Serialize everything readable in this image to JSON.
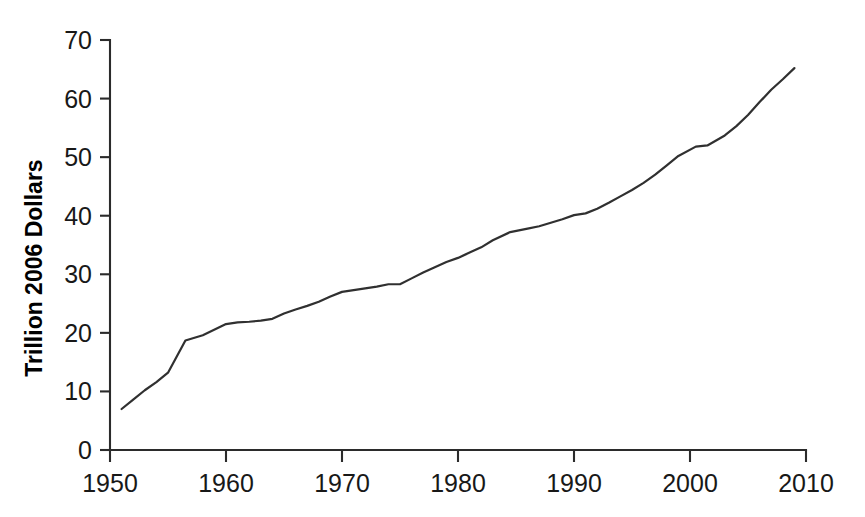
{
  "chart_data": {
    "type": "line",
    "title": "",
    "xlabel": "",
    "ylabel": "Trillion 2006 Dollars",
    "xlim": [
      1950,
      2010
    ],
    "ylim": [
      0,
      70
    ],
    "xticks": [
      1950,
      1960,
      1970,
      1980,
      1990,
      2000,
      2010
    ],
    "xtick_labels": [
      "1950",
      "1960",
      "1970",
      "1980",
      "1990",
      "2000",
      "2010"
    ],
    "yticks": [
      0,
      10,
      20,
      30,
      40,
      50,
      60,
      70
    ],
    "ytick_labels": [
      "0",
      "10",
      "20",
      "30",
      "40",
      "50",
      "60",
      "70"
    ],
    "grid": false,
    "legend": false,
    "series": [
      {
        "name": "Trillion 2006 Dollars",
        "color": "#303030",
        "x": [
          1951,
          1952,
          1953,
          1954,
          1955,
          1956.5,
          1958,
          1960,
          1961,
          1962,
          1963,
          1964,
          1965,
          1966,
          1967,
          1968,
          1969,
          1970,
          1971,
          1972,
          1973,
          1974,
          1975,
          1976,
          1977,
          1978,
          1979,
          1980,
          1981,
          1982,
          1983,
          1984.5,
          1986,
          1987,
          1988,
          1989,
          1990,
          1991,
          1992,
          1993,
          1994,
          1995,
          1996,
          1997,
          1998,
          1999,
          2000.5,
          2001.5,
          2003,
          2004,
          2005,
          2006,
          2007,
          2008,
          2009
        ],
        "y": [
          7.0,
          8.6,
          10.2,
          11.6,
          13.2,
          18.7,
          19.6,
          21.5,
          21.8,
          21.9,
          22.1,
          22.4,
          23.3,
          24.0,
          24.6,
          25.3,
          26.2,
          27.0,
          27.3,
          27.6,
          27.9,
          28.3,
          28.3,
          29.3,
          30.3,
          31.2,
          32.1,
          32.8,
          33.7,
          34.6,
          35.8,
          37.2,
          37.8,
          38.2,
          38.8,
          39.4,
          40.1,
          40.4,
          41.2,
          42.2,
          43.3,
          44.4,
          45.6,
          47.0,
          48.6,
          50.2,
          51.8,
          52.0,
          53.7,
          55.3,
          57.2,
          59.4,
          61.5,
          63.3,
          65.2
        ]
      }
    ]
  },
  "axis": {
    "y_title": "Trillion 2006 Dollars"
  }
}
